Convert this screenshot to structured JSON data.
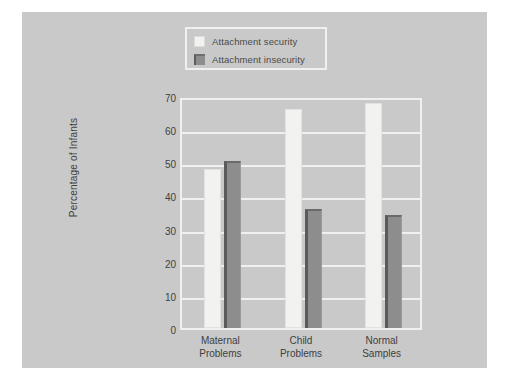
{
  "chart_data": {
    "type": "bar",
    "title": "",
    "subtitle": "",
    "xlabel": "",
    "ylabel": "Percentage of Infants",
    "categories": [
      "Maternal\nProblems",
      "Child\nProblems",
      "Normal\nSamples"
    ],
    "category_lines": [
      [
        "Maternal",
        "Problems"
      ],
      [
        "Child",
        "Problems"
      ],
      [
        "Normal",
        "Samples"
      ]
    ],
    "series": [
      {
        "name": "Attachment security",
        "values": [
          48,
          66,
          68
        ],
        "color": "#f2f2f0"
      },
      {
        "name": "Attachment insecurity",
        "values": [
          50.5,
          36,
          34
        ],
        "color": "#8d8d8d"
      }
    ],
    "ylim": [
      0,
      70
    ],
    "yticks": [
      0,
      10,
      20,
      30,
      40,
      50,
      60,
      70
    ],
    "ytick_labels": [
      "0",
      "10",
      "20",
      "30",
      "40",
      "50",
      "60",
      "70"
    ],
    "grid": "horizontal",
    "grid_color": "#f0f0ee",
    "legend_position": "top-center",
    "plot_background": "#c9c9c9",
    "figure_background": "#c9c9c9",
    "page_background": "#ffffff"
  },
  "legend": {
    "items": [
      {
        "label": "Attachment security",
        "swatch": "light-swatch-icon"
      },
      {
        "label": "Attachment insecurity",
        "swatch": "dark-swatch-icon"
      }
    ]
  },
  "axes": {
    "y_title": "Percentage of Infants",
    "y_tick_labels": [
      "70",
      "60",
      "50",
      "40",
      "30",
      "20",
      "10",
      "0"
    ]
  }
}
